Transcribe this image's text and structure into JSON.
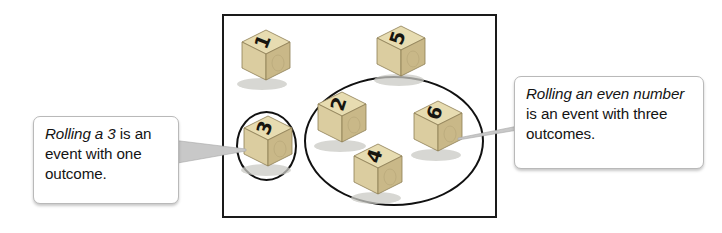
{
  "figure": {
    "background_color": "#ffffff",
    "sample_space": {
      "name": "sample-space-rectangle",
      "border_color": "#1a1a1a"
    },
    "dice": [
      {
        "value": "1",
        "label": "die-1",
        "in_event": "none"
      },
      {
        "value": "5",
        "label": "die-5",
        "in_event": "none"
      },
      {
        "value": "3",
        "label": "die-3",
        "in_event": "rolling-a-3"
      },
      {
        "value": "2",
        "label": "die-2",
        "in_event": "rolling-an-even-number"
      },
      {
        "value": "6",
        "label": "die-6",
        "in_event": "rolling-an-even-number"
      },
      {
        "value": "4",
        "label": "die-4",
        "in_event": "rolling-an-even-number"
      }
    ],
    "die_colors": {
      "top_face": "#e7dcb1",
      "left_face": "#d9cb9d",
      "right_face": "#c9b888",
      "edge": "#8d7d54",
      "shadow": "#c9c9c4"
    },
    "events": [
      {
        "name": "rolling-a-3",
        "outcomes": [
          "3"
        ],
        "outcome_count": 1,
        "oval_color": "#111111"
      },
      {
        "name": "rolling-an-even-number",
        "outcomes": [
          "2",
          "4",
          "6"
        ],
        "outcome_count": 3,
        "oval_color": "#111111"
      }
    ]
  },
  "callouts": {
    "left": {
      "emphasis": "Rolling a 3",
      "rest": " is an event with one outcome."
    },
    "right": {
      "emphasis": "Rolling an even number",
      "rest": " is an event with three outcomes."
    }
  }
}
